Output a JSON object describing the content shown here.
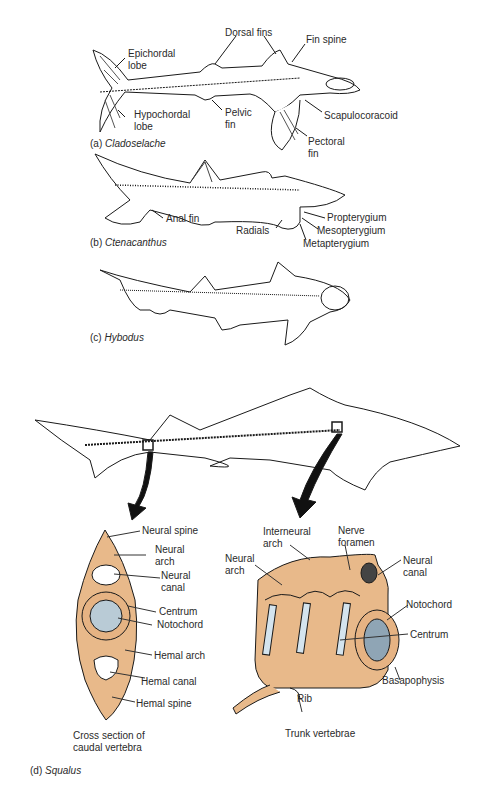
{
  "panels": {
    "a": {
      "caption_prefix": "(a)",
      "caption_name": "Cladoselache",
      "labels": {
        "dorsal_fins": "Dorsal fins",
        "fin_spine": "Fin spine",
        "epichordal_lobe_1": "Epichordal",
        "epichordal_lobe_2": "lobe",
        "hypochordal_lobe_1": "Hypochordal",
        "hypochordal_lobe_2": "lobe",
        "pelvic_fin_1": "Pelvic",
        "pelvic_fin_2": "fin",
        "scapulocoracoid": "Scapulocoracoid",
        "pectoral_fin_1": "Pectoral",
        "pectoral_fin_2": "fin"
      }
    },
    "b": {
      "caption_prefix": "(b)",
      "caption_name": "Ctenacanthus",
      "labels": {
        "anal_fin": "Anal fin",
        "radials": "Radials",
        "propterygium": "Propterygium",
        "mesopterygium": "Mesopterygium",
        "metapterygium": "Metapterygium"
      }
    },
    "c": {
      "caption_prefix": "(c)",
      "caption_name": "Hybodus"
    },
    "d": {
      "caption_prefix": "(d)",
      "caption_name": "Squalus",
      "cross_section": {
        "title_1": "Cross section of",
        "title_2": "caudal vertebra",
        "labels": {
          "neural_spine": "Neural spine",
          "neural_arch_1": "Neural",
          "neural_arch_2": "arch",
          "neural_canal_1": "Neural",
          "neural_canal_2": "canal",
          "centrum": "Centrum",
          "notochord": "Notochord",
          "hemal_arch": "Hemal arch",
          "hemal_canal": "Hemal canal",
          "hemal_spine": "Hemal spine"
        }
      },
      "trunk": {
        "title": "Trunk vertebrae",
        "labels": {
          "interneural_arch_1": "Interneural",
          "interneural_arch_2": "arch",
          "nerve_foramen_1": "Nerve",
          "nerve_foramen_2": "foramen",
          "neural_arch_1": "Neural",
          "neural_arch_2": "arch",
          "neural_canal_1": "Neural",
          "neural_canal_2": "canal",
          "notochord": "Notochord",
          "centrum": "Centrum",
          "basapophysis": "Basapophysis",
          "rib": "Rib"
        }
      }
    }
  },
  "colors": {
    "cartilage": "#e8b98a",
    "notochord": "#b9cbd6",
    "intercalary": "#d4e4ee",
    "ink": "#1a1a1a"
  }
}
